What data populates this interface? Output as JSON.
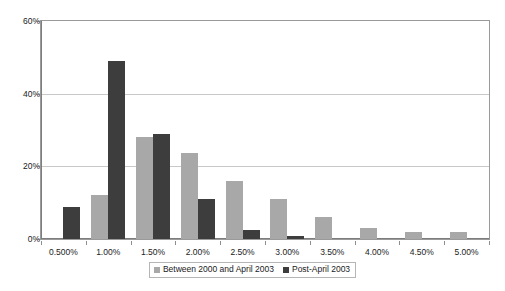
{
  "chart_data": {
    "type": "bar",
    "title": "",
    "subtitle": "",
    "xlabel": "",
    "ylabel": "",
    "grid": true,
    "legend_position": "bottom",
    "categories": [
      "0.500%",
      "1.00%",
      "1.50%",
      "2.00%",
      "2.50%",
      "3.00%",
      "3.50%",
      "4.00%",
      "4.50%",
      "5.00%"
    ],
    "ylim": [
      0,
      60
    ],
    "yticks": [
      0,
      20,
      40,
      60
    ],
    "ytick_labels": [
      "0%",
      "20%",
      "40%",
      "60%"
    ],
    "series": [
      {
        "name": "Between 2000 and April 2003",
        "color": "#a8a8a8",
        "values": [
          0,
          12,
          28,
          23.7,
          16,
          11,
          6,
          3,
          1.8,
          2
        ]
      },
      {
        "name": "Post-April 2003",
        "color": "#3d3d3d",
        "values": [
          8.7,
          49,
          29,
          11,
          2.5,
          0.8,
          0,
          0,
          0,
          0
        ]
      }
    ]
  },
  "colors": {
    "series_light": "#a8a8a8",
    "series_dark": "#3d3d3d",
    "gridline": "#c9c9c9",
    "frame": "#9a9a9a",
    "axis": "#7d7d7d",
    "background": "#ffffff",
    "text": "#1a1a1a"
  }
}
